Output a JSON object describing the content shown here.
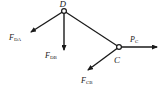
{
  "diagram": {
    "type": "free-body diagram",
    "nodes": [
      {
        "id": "D",
        "label": "D",
        "x": 64,
        "y": 11
      },
      {
        "id": "C",
        "label": "C",
        "x": 119,
        "y": 47
      }
    ],
    "members": [
      {
        "from": "D",
        "to": "C"
      }
    ],
    "forces": [
      {
        "id": "FDA",
        "symbol": "F",
        "subscript": "DA",
        "at": "D",
        "direction": "down-left"
      },
      {
        "id": "FDB",
        "symbol": "F",
        "subscript": "DB",
        "at": "D",
        "direction": "down"
      },
      {
        "id": "PC",
        "symbol": "P",
        "subscript": "C",
        "at": "C",
        "direction": "right"
      },
      {
        "id": "FCB",
        "symbol": "F",
        "subscript": "CB",
        "at": "C",
        "direction": "down-left"
      }
    ],
    "colors": {
      "line": "#1a1a1a",
      "background": "#ffffff"
    }
  }
}
